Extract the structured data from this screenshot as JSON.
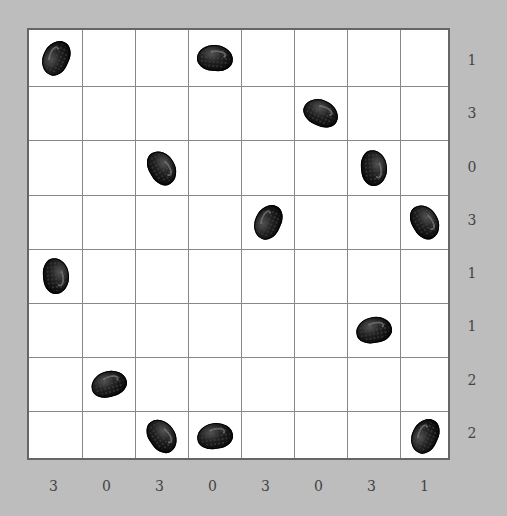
{
  "puzzle": {
    "rows": 8,
    "cols": 8,
    "row_clues": [
      "1",
      "3",
      "0",
      "3",
      "1",
      "1",
      "2",
      "2"
    ],
    "col_clues": [
      "3",
      "0",
      "3",
      "0",
      "3",
      "0",
      "3",
      "1"
    ],
    "beans": [
      {
        "row": 0,
        "col": 0,
        "rotate": -65
      },
      {
        "row": 0,
        "col": 3,
        "rotate": 5
      },
      {
        "row": 1,
        "col": 5,
        "rotate": 25
      },
      {
        "row": 2,
        "col": 2,
        "rotate": 60
      },
      {
        "row": 2,
        "col": 6,
        "rotate": 85
      },
      {
        "row": 3,
        "col": 4,
        "rotate": -65
      },
      {
        "row": 3,
        "col": 7,
        "rotate": 60
      },
      {
        "row": 4,
        "col": 0,
        "rotate": 85
      },
      {
        "row": 5,
        "col": 6,
        "rotate": -10
      },
      {
        "row": 6,
        "col": 1,
        "rotate": -15
      },
      {
        "row": 7,
        "col": 2,
        "rotate": 55
      },
      {
        "row": 7,
        "col": 3,
        "rotate": -8
      },
      {
        "row": 7,
        "col": 7,
        "rotate": -65
      }
    ]
  },
  "colors": {
    "background": "#bdbdbd",
    "board": "#ffffff",
    "grid": "#888888",
    "bean": "#0a0a0a",
    "clue": "#444444"
  }
}
